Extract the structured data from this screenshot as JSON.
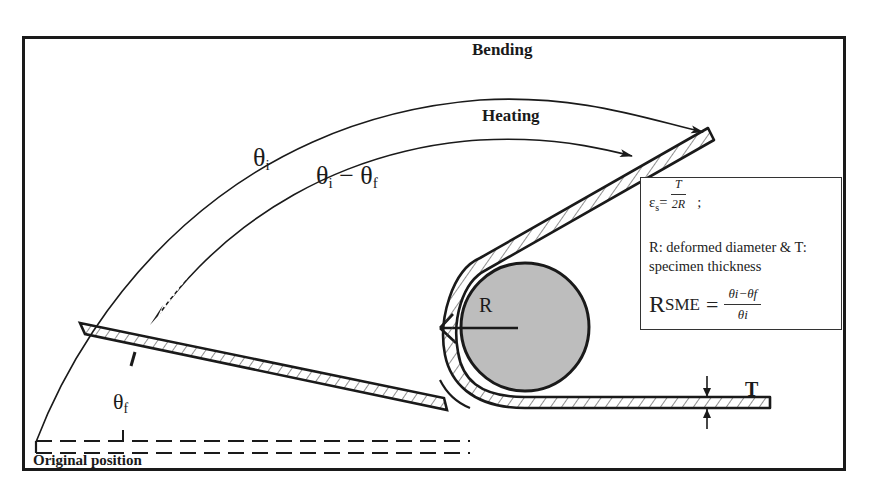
{
  "diagram": {
    "labels": {
      "bending": "Bending",
      "heating": "Heating",
      "theta_i": {
        "base": "θ",
        "sub": "i"
      },
      "theta_i_minus_theta_f": {
        "a_base": "θ",
        "a_sub": "i",
        "minus": " − ",
        "b_base": "θ",
        "b_sub": "f"
      },
      "theta_f": {
        "base": "θ",
        "sub": "f"
      },
      "radius": "R",
      "thickness": "T",
      "original_position": "Original position"
    },
    "info_box": {
      "strain": {
        "symbol": "ε",
        "symbol_sub": "s",
        "equals": "=",
        "numerator": "T",
        "denominator": "2R",
        "terminator": ";"
      },
      "note_line1": "R: deformed diameter & T:",
      "note_line2": "specimen thickness",
      "rsme": {
        "symbol": "R",
        "symbol_sub": "SME",
        "equals": "=",
        "numerator": "θi−θf",
        "denominator": "θi"
      }
    },
    "colors": {
      "line": "#1a1a1a",
      "mandrel_fill": "#bdbdbd",
      "background": "#ffffff"
    }
  }
}
